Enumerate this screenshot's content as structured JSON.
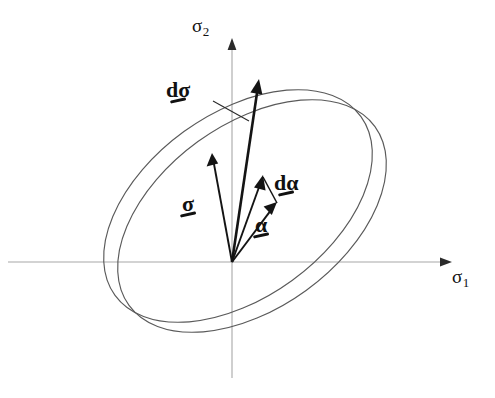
{
  "figure": {
    "background_color": "#ffffff",
    "width": 495,
    "height": 398
  },
  "axes": {
    "origin": {
      "x": 232,
      "y": 262
    },
    "horizontal": {
      "name": "sigma-1-axis",
      "label_base": "σ",
      "label_sub": "1",
      "color": "#a8a8a8",
      "from_x": 8,
      "to_x": 452,
      "y": 262
    },
    "vertical": {
      "name": "sigma-2-axis",
      "label_base": "σ",
      "label_sub": "2",
      "color": "#a8a8a8",
      "x": 232,
      "from_y": 378,
      "to_y": 40
    }
  },
  "surfaces": [
    {
      "name": "outer-yield-surface",
      "description": "initial yield surface",
      "cx": 238,
      "cy": 206,
      "rx": 152,
      "ry": 92,
      "rotation_deg": -36,
      "stroke": "#5a5a5a"
    },
    {
      "name": "translated-yield-surface",
      "description": "translated yield surface after kinematic hardening",
      "cx": 252,
      "cy": 216,
      "rx": 152,
      "ry": 92,
      "rotation_deg": -36,
      "stroke": "#5a5a5a"
    }
  ],
  "vectors": [
    {
      "name": "d-sigma-vector",
      "label": "dσ",
      "label_x": 166,
      "label_y": 79,
      "from_x": 232,
      "from_y": 262,
      "to_x": 259,
      "to_y": 80,
      "weight": "thick",
      "leader": {
        "from_x": 213,
        "from_y": 101,
        "to_x": 248,
        "to_y": 120
      }
    },
    {
      "name": "sigma-vector",
      "label": "σ",
      "label_x": 182,
      "label_y": 193,
      "from_x": 232,
      "from_y": 262,
      "to_x": 212,
      "to_y": 154,
      "weight": "med",
      "leader": null
    },
    {
      "name": "alpha-vector",
      "label": "α",
      "label_x": 255,
      "label_y": 214,
      "from_x": 232,
      "from_y": 262,
      "to_x": 276,
      "to_y": 203,
      "weight": "med",
      "leader": null
    },
    {
      "name": "d-alpha-vector",
      "label": "dα",
      "label_x": 274,
      "label_y": 172,
      "from_x": 232,
      "from_y": 262,
      "to_x": 263,
      "to_y": 176,
      "weight": "med",
      "leader": null
    }
  ],
  "connector": {
    "name": "alpha-d-alpha-connector",
    "from_x": 263,
    "from_y": 176,
    "to_x": 276,
    "to_y": 203
  }
}
